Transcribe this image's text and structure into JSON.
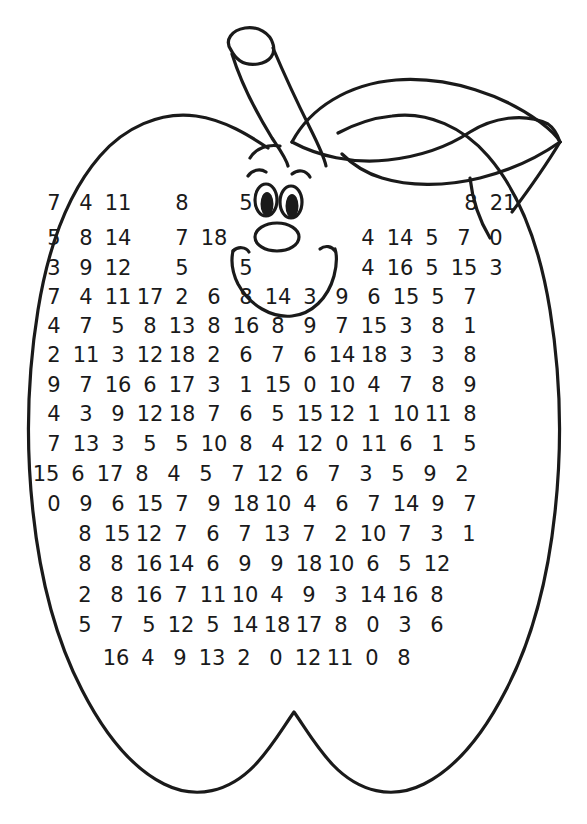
{
  "worksheet": {
    "title": "Apple Number Search",
    "shape": "apple-outline",
    "face": {
      "expression": "smiling",
      "parts": [
        "left-eyebrow",
        "right-eyebrow",
        "left-eye",
        "right-eye",
        "nose",
        "mouth"
      ]
    },
    "colors": {
      "outline": "#1a1a1a",
      "background": "#ffffff",
      "text": "#1a1a1a"
    }
  },
  "grid": {
    "row_count": 17,
    "rows": [
      {
        "y": 193,
        "left": 38,
        "cells": [
          "7",
          "4",
          "11",
          "",
          "8",
          "",
          "5"
        ]
      },
      {
        "y": 228,
        "left": 38,
        "cells": [
          "5",
          "8",
          "14",
          "",
          "7",
          "18"
        ]
      },
      {
        "y": 258,
        "left": 38,
        "cells": [
          "3",
          "9",
          "12",
          "",
          "5",
          "",
          "5"
        ]
      },
      {
        "y": 287,
        "left": 38,
        "cells": [
          "7",
          "4",
          "11",
          "17",
          "2",
          "6",
          "8",
          "14",
          "3",
          "9",
          "6",
          "15",
          "5",
          "7"
        ]
      },
      {
        "y": 316,
        "left": 38,
        "cells": [
          "4",
          "7",
          "5",
          "8",
          "13",
          "8",
          "16",
          "8",
          "9",
          "7",
          "15",
          "3",
          "8",
          "1"
        ]
      },
      {
        "y": 345,
        "left": 38,
        "cells": [
          "2",
          "11",
          "3",
          "12",
          "18",
          "2",
          "6",
          "7",
          "6",
          "14",
          "18",
          "3",
          "3",
          "8"
        ]
      },
      {
        "y": 375,
        "left": 38,
        "cells": [
          "9",
          "7",
          "16",
          "6",
          "17",
          "3",
          "1",
          "15",
          "0",
          "10",
          "4",
          "7",
          "8",
          "9"
        ]
      },
      {
        "y": 404,
        "left": 38,
        "cells": [
          "4",
          "3",
          "9",
          "12",
          "18",
          "7",
          "6",
          "5",
          "15",
          "12",
          "1",
          "10",
          "11",
          "8"
        ]
      },
      {
        "y": 434,
        "left": 38,
        "cells": [
          "7",
          "13",
          "3",
          "5",
          "5",
          "10",
          "8",
          "4",
          "12",
          "0",
          "11",
          "6",
          "1",
          "5"
        ]
      },
      {
        "y": 464,
        "left": 30,
        "cells": [
          "15",
          "6",
          "17",
          "8",
          "4",
          "5",
          "7",
          "12",
          "6",
          "7",
          "3",
          "5",
          "9",
          "2"
        ]
      },
      {
        "y": 494,
        "left": 38,
        "cells": [
          "0",
          "9",
          "6",
          "15",
          "7",
          "9",
          "18",
          "10",
          "4",
          "6",
          "7",
          "14",
          "9",
          "7"
        ]
      },
      {
        "y": 524,
        "left": 69,
        "cells": [
          "8",
          "15",
          "12",
          "7",
          "6",
          "7",
          "13",
          "7",
          "2",
          "10",
          "7",
          "3",
          "1"
        ]
      },
      {
        "y": 554,
        "left": 69,
        "cells": [
          "8",
          "8",
          "16",
          "14",
          "6",
          "9",
          "9",
          "18",
          "10",
          "6",
          "5",
          "12"
        ]
      },
      {
        "y": 585,
        "left": 69,
        "cells": [
          "2",
          "8",
          "16",
          "7",
          "11",
          "10",
          "4",
          "9",
          "3",
          "14",
          "16",
          "8"
        ]
      },
      {
        "y": 615,
        "left": 69,
        "cells": [
          "5",
          "7",
          "5",
          "12",
          "5",
          "14",
          "18",
          "17",
          "8",
          "0",
          "3",
          "6"
        ]
      },
      {
        "y": 648,
        "left": 100,
        "cells": [
          "16",
          "4",
          "9",
          "13",
          "2",
          "0",
          "12",
          "11",
          "0",
          "8"
        ]
      }
    ],
    "top_right_rows": [
      {
        "y": 193,
        "left": 455,
        "cells": [
          "8",
          "21"
        ]
      },
      {
        "y": 228,
        "left": 352,
        "cells": [
          "4",
          "14",
          "5",
          "7",
          "0"
        ]
      },
      {
        "y": 258,
        "left": 352,
        "cells": [
          "4",
          "16",
          "5",
          "15",
          "3"
        ]
      }
    ]
  },
  "icons": {
    "apple_body": "apple-outline-icon",
    "stem": "apple-stem-icon",
    "leaf": "apple-leaf-icon",
    "eyes": "eyes-icon",
    "nose": "nose-icon",
    "mouth": "smile-icon",
    "eyebrows": "eyebrows-icon"
  }
}
